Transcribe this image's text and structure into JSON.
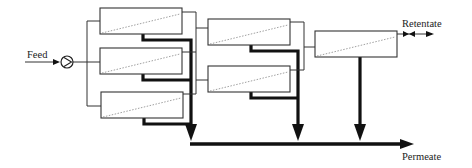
{
  "diagram": {
    "type": "process flow diagram",
    "labels": {
      "feed": "Feed",
      "retentate": "Retentate",
      "permeate": "Permeate"
    },
    "stages": [
      {
        "name": "stage-1",
        "modules": 3
      },
      {
        "name": "stage-2",
        "modules": 2
      },
      {
        "name": "stage-3",
        "modules": 1
      }
    ],
    "components": [
      "feed-inlet",
      "pump",
      "membrane-modules",
      "retentate-valve",
      "permeate-collector"
    ],
    "colors": {
      "line": "#333333",
      "permeate_line": "#111111",
      "membrane_dotted": "#888888",
      "background": "#ffffff"
    }
  }
}
